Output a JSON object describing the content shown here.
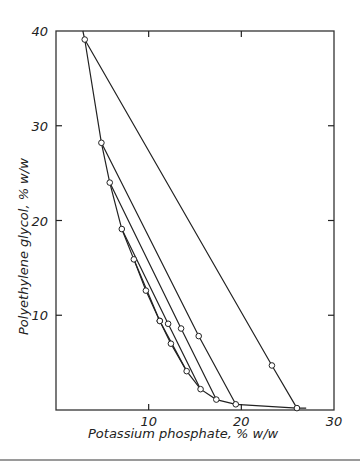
{
  "chart_data": {
    "type": "line",
    "title": "",
    "xlabel": "Potassium phosphate,  % w/w",
    "ylabel": "Polyethylene glycol,  % w/w",
    "xlim": [
      0,
      30
    ],
    "ylim": [
      0,
      40
    ],
    "grid": false,
    "legend": null,
    "x_ticks": [
      10,
      20,
      30
    ],
    "y_ticks": [
      10,
      20,
      30,
      40
    ],
    "binodal_curve": {
      "name": "binodal",
      "points": [
        [
          2.9,
          40.0
        ],
        [
          3.1,
          39.1
        ],
        [
          4.9,
          28.2
        ],
        [
          5.8,
          24.0
        ],
        [
          7.1,
          19.1
        ],
        [
          8.4,
          15.9
        ],
        [
          9.7,
          12.6
        ],
        [
          11.2,
          9.4
        ],
        [
          12.4,
          7.0
        ],
        [
          14.1,
          4.1
        ],
        [
          15.6,
          2.2
        ],
        [
          17.3,
          1.1
        ],
        [
          19.4,
          0.6
        ],
        [
          26.0,
          0.2
        ],
        [
          27.0,
          0.2
        ]
      ]
    },
    "tie_lines": [
      {
        "top": [
          3.1,
          39.1
        ],
        "mid": [
          23.3,
          4.7
        ],
        "bottom": [
          26.0,
          0.2
        ]
      },
      {
        "top": [
          4.9,
          28.2
        ],
        "mid": [
          15.4,
          7.8
        ],
        "bottom": [
          19.4,
          0.6
        ]
      },
      {
        "top": [
          5.8,
          24.0
        ],
        "mid": [
          13.5,
          8.6
        ],
        "bottom": [
          17.3,
          1.1
        ]
      },
      {
        "top": [
          7.1,
          19.1
        ],
        "mid": [
          12.1,
          9.1
        ],
        "bottom": [
          15.6,
          2.2
        ]
      },
      {
        "top": [
          8.4,
          15.9
        ],
        "mid": [
          11.2,
          9.4
        ],
        "bottom": [
          14.1,
          4.1
        ]
      }
    ]
  },
  "labels": {
    "xlabel": "Potassium phosphate,  % w/w",
    "ylabel": "Polyethylene glycol,  % w/w"
  }
}
